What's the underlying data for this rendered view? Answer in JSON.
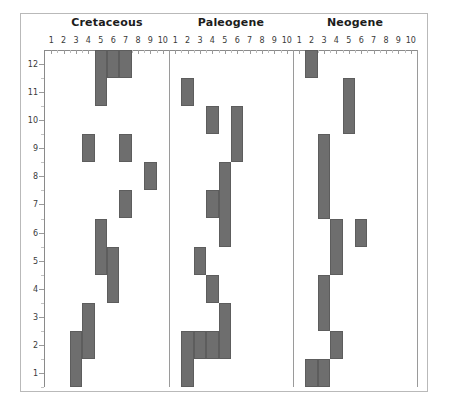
{
  "figure": {
    "yaxis": {
      "ticks": [
        1,
        2,
        3,
        4,
        5,
        6,
        7,
        8,
        9,
        10,
        11,
        12
      ],
      "min": 0.5,
      "max": 12.5
    },
    "xaxis": {
      "ticks": [
        1,
        2,
        3,
        4,
        5,
        6,
        7,
        8,
        9,
        10
      ],
      "min": 0.5,
      "max": 10.5
    }
  },
  "chart_data": {
    "type": "bar",
    "orientation": "vertical-range",
    "title": "",
    "xlabel": "",
    "ylabel": "",
    "xlim": [
      0.5,
      10.5
    ],
    "ylim": [
      0.5,
      12.5
    ],
    "grid": false,
    "legend": null,
    "bar_color": "#6e6e6e",
    "panels": [
      {
        "name": "Cretaceous",
        "xticks": [
          1,
          2,
          3,
          4,
          5,
          6,
          7,
          8,
          9,
          10
        ],
        "bars": [
          {
            "x": 5,
            "y_top": 12.5,
            "y_bottom": 10.5
          },
          {
            "x": 6,
            "y_top": 12.5,
            "y_bottom": 11.5
          },
          {
            "x": 7,
            "y_top": 12.5,
            "y_bottom": 11.5
          },
          {
            "x": 4,
            "y_top": 9.5,
            "y_bottom": 8.5
          },
          {
            "x": 7,
            "y_top": 9.5,
            "y_bottom": 8.5
          },
          {
            "x": 9,
            "y_top": 8.5,
            "y_bottom": 7.5
          },
          {
            "x": 7,
            "y_top": 7.5,
            "y_bottom": 6.5
          },
          {
            "x": 5,
            "y_top": 6.5,
            "y_bottom": 4.5
          },
          {
            "x": 6,
            "y_top": 5.5,
            "y_bottom": 3.5
          },
          {
            "x": 4,
            "y_top": 3.5,
            "y_bottom": 1.5
          },
          {
            "x": 3,
            "y_top": 2.5,
            "y_bottom": 0.5
          }
        ]
      },
      {
        "name": "Paleogene",
        "xticks": [
          1,
          2,
          3,
          4,
          5,
          6,
          7,
          8,
          9,
          10
        ],
        "bars": [
          {
            "x": 2,
            "y_top": 11.5,
            "y_bottom": 10.5
          },
          {
            "x": 4,
            "y_top": 10.5,
            "y_bottom": 9.5
          },
          {
            "x": 6,
            "y_top": 10.5,
            "y_bottom": 8.5
          },
          {
            "x": 5,
            "y_top": 8.5,
            "y_bottom": 5.5
          },
          {
            "x": 4,
            "y_top": 7.5,
            "y_bottom": 6.5
          },
          {
            "x": 3,
            "y_top": 5.5,
            "y_bottom": 4.5
          },
          {
            "x": 4,
            "y_top": 4.5,
            "y_bottom": 3.5
          },
          {
            "x": 5,
            "y_top": 3.5,
            "y_bottom": 1.5
          },
          {
            "x": 3,
            "y_top": 2.5,
            "y_bottom": 1.5
          },
          {
            "x": 4,
            "y_top": 2.5,
            "y_bottom": 1.5
          },
          {
            "x": 2,
            "y_top": 2.5,
            "y_bottom": 0.5
          }
        ]
      },
      {
        "name": "Neogene",
        "xticks": [
          1,
          2,
          3,
          4,
          5,
          6,
          7,
          8,
          9,
          10
        ],
        "bars": [
          {
            "x": 2,
            "y_top": 12.5,
            "y_bottom": 11.5
          },
          {
            "x": 5,
            "y_top": 11.5,
            "y_bottom": 9.5
          },
          {
            "x": 3,
            "y_top": 9.5,
            "y_bottom": 6.5
          },
          {
            "x": 4,
            "y_top": 6.5,
            "y_bottom": 4.5
          },
          {
            "x": 6,
            "y_top": 6.5,
            "y_bottom": 5.5
          },
          {
            "x": 3,
            "y_top": 4.5,
            "y_bottom": 2.5
          },
          {
            "x": 4,
            "y_top": 2.5,
            "y_bottom": 1.5
          },
          {
            "x": 2,
            "y_top": 1.5,
            "y_bottom": 0.5
          },
          {
            "x": 3,
            "y_top": 1.5,
            "y_bottom": 0.5
          }
        ]
      }
    ]
  }
}
